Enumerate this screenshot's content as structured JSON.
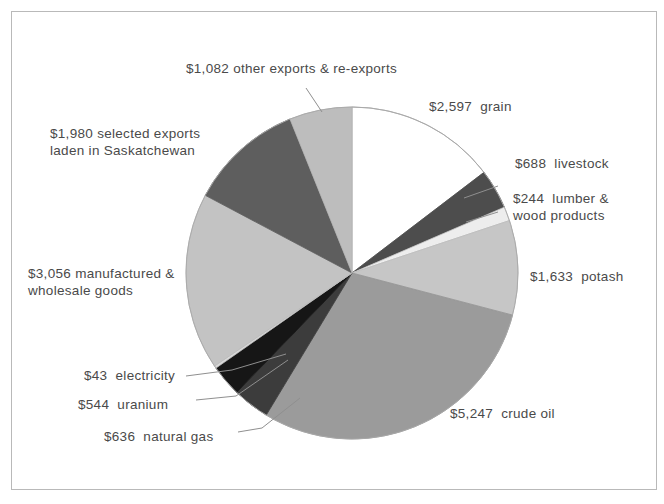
{
  "chart_data": {
    "type": "pie",
    "title": "",
    "subtitle": "",
    "units": "millions of dollars",
    "total": 17750,
    "legend_position": "callout-labels",
    "grid": false,
    "start_angle_deg": 0,
    "direction": "clockwise",
    "categories": [
      "grain",
      "livestock",
      "lumber & wood products",
      "potash",
      "crude oil",
      "natural gas",
      "uranium",
      "electricity",
      "manufactured & wholesale goods",
      "selected exports laden in Saskatchewan",
      "other exports & re-exports"
    ],
    "values": [
      2597,
      688,
      244,
      1633,
      5247,
      636,
      544,
      43,
      3056,
      1980,
      1082
    ],
    "slices": [
      {
        "label": "grain",
        "value": 2597,
        "value_text": "$2,597",
        "label_text": "grain",
        "fill": "#ffffff",
        "stroke": "#9a9a9a"
      },
      {
        "label": "livestock",
        "value": 688,
        "value_text": "$688",
        "label_text": "livestock",
        "fill": "#4d4d4d",
        "stroke": "#4d4d4d"
      },
      {
        "label": "lumber & wood products",
        "value": 244,
        "value_text": "$244",
        "label_text": "lumber &\nwood products",
        "fill": "#ededed",
        "stroke": "#c8c8c8"
      },
      {
        "label": "potash",
        "value": 1633,
        "value_text": "$1,633",
        "label_text": "potash",
        "fill": "#c6c6c6",
        "stroke": "#bcbcbc"
      },
      {
        "label": "crude oil",
        "value": 5247,
        "value_text": "$5,247",
        "label_text": "crude oil",
        "fill": "#9b9b9b",
        "stroke": "#949494"
      },
      {
        "label": "natural gas",
        "value": 636,
        "value_text": "$636",
        "label_text": "natural gas",
        "fill": "#3c3c3c",
        "stroke": "#3c3c3c"
      },
      {
        "label": "uranium",
        "value": 544,
        "value_text": "$544",
        "label_text": "uranium",
        "fill": "#161616",
        "stroke": "#161616"
      },
      {
        "label": "electricity",
        "value": 43,
        "value_text": "$43",
        "label_text": "electricity",
        "fill": "#d9d9d9",
        "stroke": "#bdbdbd"
      },
      {
        "label": "manufactured & wholesale goods",
        "value": 3056,
        "value_text": "$3,056",
        "label_text": "manufactured &\nwholesale goods",
        "fill": "#c3c3c3",
        "stroke": "#bababa"
      },
      {
        "label": "selected exports laden in Saskatchewan",
        "value": 1980,
        "value_text": "$1,980",
        "label_text": "selected exports\nladen in Saskatchewan",
        "fill": "#5e5e5e",
        "stroke": "#5e5e5e"
      },
      {
        "label": "other exports & re-exports",
        "value": 1082,
        "value_text": "$1,082",
        "label_text": "other exports & re-exports",
        "fill": "#bdbdbd",
        "stroke": "#b4b4b4"
      }
    ]
  },
  "labels": {
    "grain": "$2,597  grain",
    "livestock": "$688  livestock",
    "lumber": "$244  lumber &\nwood products",
    "potash": "$1,633  potash",
    "crude_oil": "$5,247  crude oil",
    "natural_gas": "$636  natural gas",
    "uranium": "$544  uranium",
    "electricity": "$43  electricity",
    "manufactured": "$3,056 manufactured &\nwholesale goods",
    "selected_exports": "$1,980 selected exports\nladen in Saskatchewan",
    "other_exports": "$1,082 other exports & re-exports"
  },
  "colors": {
    "text": "#4a4a4a",
    "frame": "#b9b9b9",
    "leader": "#8f8f8f",
    "background": "#ffffff"
  }
}
